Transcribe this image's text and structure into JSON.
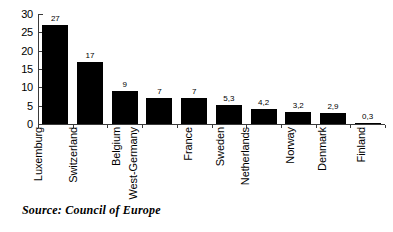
{
  "chart_data": {
    "type": "bar",
    "title": "",
    "subtitle": "",
    "xlabel": "",
    "ylabel": "",
    "categories": [
      "Luxemburg",
      "Switzerland",
      "Belgium",
      "West-Germany",
      "France",
      "Sweden",
      "Netherlands",
      "Norway",
      "Denmark",
      "Finland"
    ],
    "values": [
      27,
      17,
      9,
      7,
      7,
      5.3,
      4.2,
      3.2,
      2.9,
      0.3
    ],
    "value_labels": [
      "27",
      "17",
      "9",
      "7",
      "7",
      "5,3",
      "4,2",
      "3,2",
      "2,9",
      "0,3"
    ],
    "ylim": [
      0,
      30
    ],
    "yticks": [
      0,
      5,
      10,
      15,
      20,
      25,
      30
    ],
    "ytick_labels": [
      "0",
      "5",
      "10",
      "15",
      "20",
      "25",
      "30"
    ],
    "grid": false,
    "legend": false,
    "bar_color": "#000000",
    "axis_color": "#3a3a3a"
  },
  "source": {
    "text": "Source: Council of Europe"
  }
}
